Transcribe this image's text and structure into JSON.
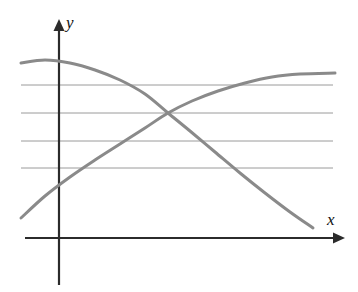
{
  "figure": {
    "title": "",
    "background_color": "#ffffff",
    "width": 358,
    "height": 292
  },
  "axes": {
    "x_axis": {
      "label": "x",
      "icon": "arrow-right-icon",
      "color": "#2b2b2b",
      "y_position": 238,
      "start_x": 25,
      "end_x": 345
    },
    "y_axis": {
      "label": "y",
      "icon": "arrow-up-icon",
      "color": "#2b2b2b",
      "x_position": 59,
      "start_y": 19,
      "end_y": 285
    }
  },
  "gridlines": {
    "color": "#9a9a9a",
    "orientation": "horizontal",
    "count": 4,
    "x_start": 21,
    "x_end": 333,
    "y_values": [
      85,
      113,
      141,
      168
    ]
  },
  "chart_data": {
    "type": "line",
    "title": "",
    "xlabel": "x",
    "ylabel": "y",
    "grid": true,
    "legend": "none",
    "xlim": [
      0,
      358
    ],
    "ylim": [
      0,
      292
    ],
    "series": [
      {
        "name": "decreasing-curve",
        "color": "#8a8a8a",
        "shape": "concave-down-decreasing",
        "points": [
          [
            21,
            63
          ],
          [
            45,
            60
          ],
          [
            70,
            63
          ],
          [
            95,
            70
          ],
          [
            120,
            80
          ],
          [
            145,
            94
          ],
          [
            168,
            113
          ],
          [
            190,
            131
          ],
          [
            215,
            152
          ],
          [
            240,
            173
          ],
          [
            265,
            193
          ],
          [
            290,
            212
          ],
          [
            313,
            228
          ]
        ]
      },
      {
        "name": "increasing-curve",
        "color": "#8a8a8a",
        "shape": "concave-down-increasing",
        "points": [
          [
            21,
            218
          ],
          [
            45,
            196
          ],
          [
            70,
            177
          ],
          [
            95,
            160
          ],
          [
            120,
            144
          ],
          [
            145,
            128
          ],
          [
            168,
            113
          ],
          [
            192,
            101
          ],
          [
            218,
            91
          ],
          [
            245,
            83
          ],
          [
            272,
            77
          ],
          [
            300,
            74
          ],
          [
            335,
            73
          ]
        ]
      }
    ],
    "annotations": [
      {
        "name": "curve-intersection",
        "x": 168,
        "y": 113,
        "label": ""
      }
    ]
  }
}
